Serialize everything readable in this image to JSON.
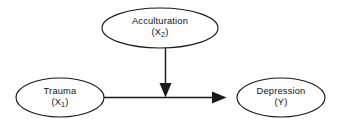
{
  "diagram": {
    "type": "path-moderation-diagram",
    "background_color": "#ffffff",
    "stroke_color": "#1a1a1a",
    "nodes": [
      {
        "id": "acculturation",
        "label": "Acculturation",
        "variable_prefix": "(X",
        "variable_subscript": "2",
        "variable_suffix": ")",
        "variable_code": "(X2)",
        "shape": "ellipse",
        "position": "top-center"
      },
      {
        "id": "trauma",
        "label": "Trauma",
        "variable_prefix": "(X",
        "variable_subscript": "1",
        "variable_suffix": ")",
        "variable_code": "(X1)",
        "shape": "ellipse",
        "position": "left"
      },
      {
        "id": "depression",
        "label": "Depression",
        "variable_prefix": "(Y",
        "variable_subscript": "",
        "variable_suffix": ")",
        "variable_code": "(Y)",
        "shape": "ellipse",
        "position": "right"
      }
    ],
    "edges": [
      {
        "id": "trauma-to-depression",
        "from": "trauma",
        "to": "depression",
        "orientation": "horizontal",
        "arrowhead": "filled-triangle"
      },
      {
        "id": "acculturation-to-path",
        "from": "acculturation",
        "to": "trauma-to-depression",
        "orientation": "vertical",
        "arrowhead": "filled-triangle"
      }
    ]
  }
}
